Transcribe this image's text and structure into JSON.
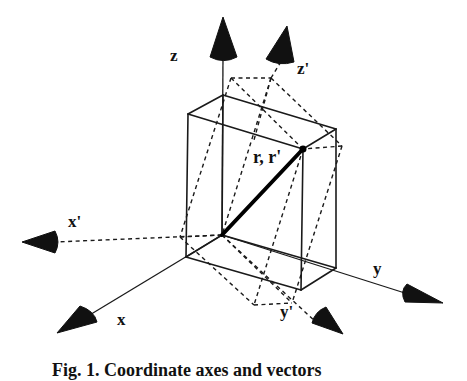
{
  "figure": {
    "caption": "Fig. 1. Coordinate axes and vectors",
    "labels": {
      "z": "z",
      "z_prime": "z'",
      "x": "x",
      "x_prime": "x'",
      "y": "y",
      "y_prime": "y'",
      "vector": "r, r'"
    },
    "colors": {
      "ink": "#111111",
      "background": "#ffffff"
    },
    "origin": [
      222,
      235
    ],
    "axes": {
      "z": {
        "line": [
          [
            222,
            235
          ],
          [
            223,
            55
          ]
        ],
        "cone": [
          [
            223,
            17
          ],
          [
            210,
            57
          ],
          [
            237,
            57
          ]
        ],
        "style": "solid"
      },
      "x": {
        "line": [
          [
            222,
            235
          ],
          [
            88,
            316
          ]
        ],
        "cone": [
          [
            57,
            333
          ],
          [
            80,
            306
          ],
          [
            97,
            322
          ]
        ],
        "style": "solid"
      },
      "y": {
        "line": [
          [
            222,
            235
          ],
          [
            408,
            294
          ]
        ],
        "cone": [
          [
            443,
            303
          ],
          [
            407,
            284
          ],
          [
            405,
            302
          ]
        ],
        "style": "solid"
      },
      "z_prime": {
        "line": [
          [
            271,
            78
          ],
          [
            282,
            60
          ]
        ],
        "cone": [
          [
            287,
            26
          ],
          [
            266,
            59
          ],
          [
            294,
            62
          ]
        ],
        "style": "dashed"
      },
      "x_prime": {
        "line": [
          [
            222,
            235
          ],
          [
            55,
            242
          ]
        ],
        "cone": [
          [
            22,
            242
          ],
          [
            55,
            231
          ],
          [
            55,
            253
          ]
        ],
        "style": "dashed"
      },
      "y_prime": {
        "line": [
          [
            222,
            235
          ],
          [
            318,
            324
          ]
        ],
        "cone": [
          [
            343,
            334
          ],
          [
            312,
            323
          ],
          [
            326,
            307
          ]
        ],
        "style": "dashed"
      }
    },
    "solid_box": {
      "edges": [
        [
          [
            188,
            114
          ],
          [
            223,
            95
          ]
        ],
        [
          [
            223,
            95
          ],
          [
            336,
            129
          ]
        ],
        [
          [
            336,
            129
          ],
          [
            303,
            149
          ]
        ],
        [
          [
            303,
            149
          ],
          [
            188,
            114
          ]
        ],
        [
          [
            188,
            114
          ],
          [
            186,
            257
          ]
        ],
        [
          [
            303,
            149
          ],
          [
            301,
            290
          ]
        ],
        [
          [
            336,
            129
          ],
          [
            336,
            268
          ]
        ],
        [
          [
            223,
            95
          ],
          [
            222,
            235
          ]
        ],
        [
          [
            186,
            257
          ],
          [
            301,
            290
          ]
        ],
        [
          [
            301,
            290
          ],
          [
            336,
            268
          ]
        ],
        [
          [
            186,
            257
          ],
          [
            222,
            235
          ]
        ],
        [
          [
            222,
            235
          ],
          [
            336,
            268
          ]
        ]
      ]
    },
    "rotated_box": {
      "edges": [
        [
          [
            231,
            78
          ],
          [
            271,
            78
          ]
        ],
        [
          [
            271,
            78
          ],
          [
            342,
            146
          ]
        ],
        [
          [
            342,
            146
          ],
          [
            303,
            149
          ]
        ],
        [
          [
            231,
            78
          ],
          [
            303,
            149
          ]
        ],
        [
          [
            231,
            78
          ],
          [
            180,
            237
          ]
        ],
        [
          [
            271,
            78
          ],
          [
            254,
            140
          ]
        ],
        [
          [
            180,
            237
          ],
          [
            222,
            235
          ]
        ],
        [
          [
            180,
            237
          ],
          [
            254,
            305
          ]
        ],
        [
          [
            254,
            305
          ],
          [
            292,
            303
          ]
        ],
        [
          [
            222,
            235
          ],
          [
            292,
            303
          ]
        ],
        [
          [
            342,
            146
          ],
          [
            292,
            303
          ]
        ],
        [
          [
            303,
            149
          ],
          [
            254,
            305
          ]
        ],
        [
          [
            271,
            78
          ],
          [
            222,
            235
          ]
        ]
      ]
    },
    "vector": {
      "from": [
        222,
        235
      ],
      "to": [
        303,
        149
      ]
    }
  }
}
